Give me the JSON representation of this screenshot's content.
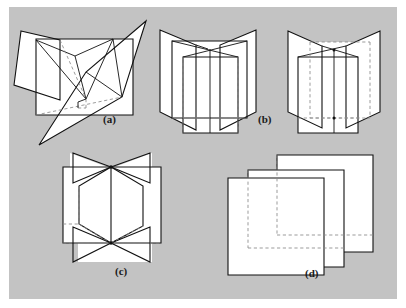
{
  "figure": {
    "kind": "geometry-illustration",
    "background_color": "#c3c3c3",
    "page_color": "#ffffff",
    "face_color": "#ffffff",
    "visible_edge_color": "#111111",
    "hidden_edge_color": "#8a8a8a",
    "hidden_edge_style": "dashed"
  },
  "panels": [
    {
      "id": "a",
      "label": "(a)",
      "label_x": 103,
      "label_y": 118,
      "description": "three planes meeting in a single common point",
      "plane_count": 3
    },
    {
      "id": "b",
      "label": "(b)",
      "label_x": 258,
      "label_y": 118,
      "description": "three planes intersecting pairwise in three parallel lines",
      "plane_count": 3
    },
    {
      "id": "c",
      "label": "(c)",
      "label_x": 115,
      "label_y": 270,
      "description": "three planes sharing one common line of intersection",
      "plane_count": 3
    },
    {
      "id": "d",
      "label": "(d)",
      "label_x": 305,
      "label_y": 272,
      "description": "three parallel planes with no common point",
      "plane_count": 3
    }
  ]
}
